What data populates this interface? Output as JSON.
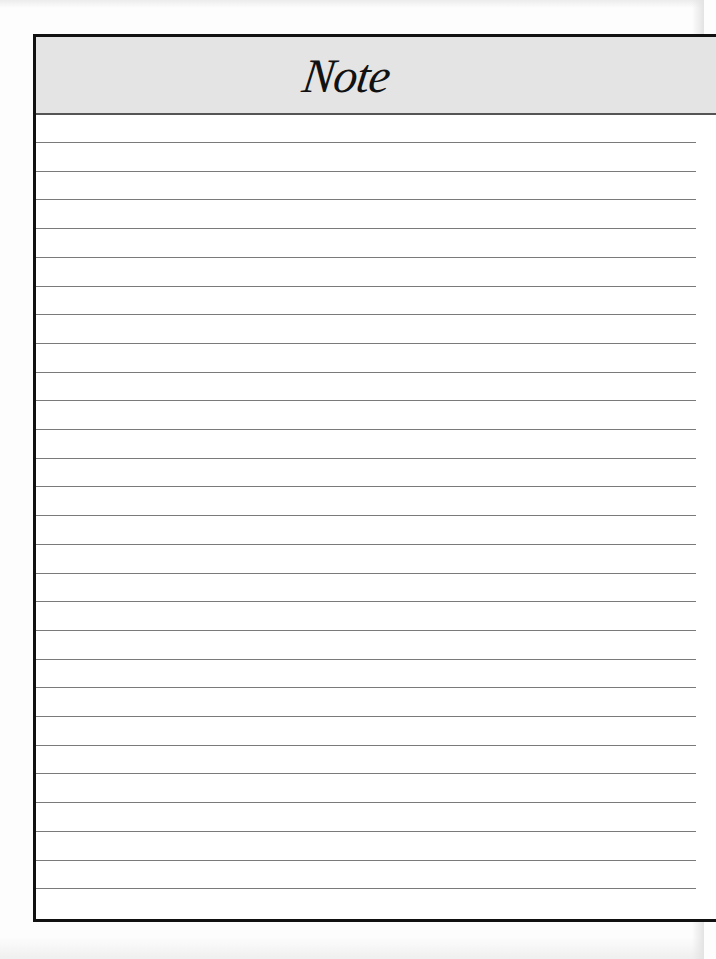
{
  "page": {
    "title": "Note",
    "header_background": "#e4e4e4",
    "border_color": "#111111",
    "rule_color": "#7a7a7a",
    "rule_count": 27,
    "rule_spacing_px": 28.7
  }
}
